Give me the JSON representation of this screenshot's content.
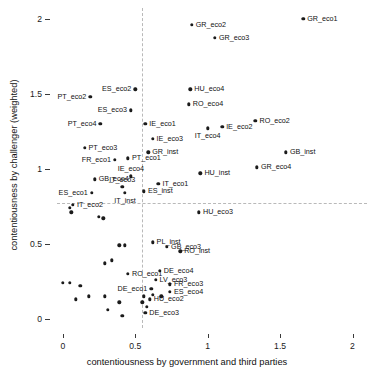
{
  "chart_data": {
    "type": "scatter",
    "title": "",
    "xlabel": "contentiousness by government and third parties",
    "ylabel": "contentiousness by challenger (weighted)",
    "xlim": [
      -0.04,
      2.1
    ],
    "ylim": [
      -0.06,
      2.07
    ],
    "xticks": [
      0,
      0.5,
      1,
      1.5,
      2
    ],
    "xticklabels": [
      "0",
      "0.5",
      "1",
      "1.5",
      "2"
    ],
    "yticks": [
      0,
      0.5,
      1,
      1.5,
      2
    ],
    "yticklabels": [
      "0",
      "0.5",
      "1",
      "1.5",
      "2"
    ],
    "grid": false,
    "legend": null,
    "reference_lines": [
      {
        "orientation": "vertical",
        "value": 0.55,
        "style": "dashed",
        "color": "#b9b9b9"
      },
      {
        "orientation": "horizontal",
        "value": 0.77,
        "style": "dashed",
        "color": "#b9b9b9"
      }
    ],
    "marker_color": "#1b1b1b",
    "points": [
      {
        "label": "GR_eco1",
        "x": 1.66,
        "y": 2.0,
        "pos": "right"
      },
      {
        "label": "GR_eco2",
        "x": 0.89,
        "y": 1.96,
        "pos": "right"
      },
      {
        "label": "GR_eco3",
        "x": 1.05,
        "y": 1.87,
        "pos": "right"
      },
      {
        "label": "ES_eco2",
        "x": 0.5,
        "y": 1.53,
        "pos": "left"
      },
      {
        "label": "HU_eco4",
        "x": 0.88,
        "y": 1.53,
        "pos": "right"
      },
      {
        "label": "PT_eco2",
        "x": 0.19,
        "y": 1.48,
        "pos": "left"
      },
      {
        "label": "RO_eco4",
        "x": 0.87,
        "y": 1.43,
        "pos": "right"
      },
      {
        "label": "ES_eco3",
        "x": 0.47,
        "y": 1.39,
        "pos": "left"
      },
      {
        "label": "RO_eco2",
        "x": 1.33,
        "y": 1.32,
        "pos": "right"
      },
      {
        "label": "IE_eco1",
        "x": 0.57,
        "y": 1.3,
        "pos": "right"
      },
      {
        "label": "PT_eco4",
        "x": 0.26,
        "y": 1.3,
        "pos": "left"
      },
      {
        "label": "IE_eco2",
        "x": 1.1,
        "y": 1.28,
        "pos": "right"
      },
      {
        "label": "IT_eco4",
        "x": 1.0,
        "y": 1.27,
        "pos": "below"
      },
      {
        "label": "IE_eco3",
        "x": 0.62,
        "y": 1.2,
        "pos": "right"
      },
      {
        "label": "PT_eco3",
        "x": 0.15,
        "y": 1.14,
        "pos": "right"
      },
      {
        "label": "GB_inst",
        "x": 1.54,
        "y": 1.11,
        "pos": "right"
      },
      {
        "label": "GR_inst",
        "x": 0.59,
        "y": 1.11,
        "pos": "right"
      },
      {
        "label": "PT_eco1",
        "x": 0.45,
        "y": 1.07,
        "pos": "right"
      },
      {
        "label": "FR_eco1",
        "x": 0.36,
        "y": 1.06,
        "pos": "left"
      },
      {
        "label": "GR_eco4",
        "x": 1.34,
        "y": 1.01,
        "pos": "right"
      },
      {
        "label": "HU_inst",
        "x": 0.95,
        "y": 0.97,
        "pos": "right"
      },
      {
        "label": "IE_eco4",
        "x": 0.47,
        "y": 0.95,
        "pos": "above"
      },
      {
        "label": "GB_eco4",
        "x": 0.22,
        "y": 0.93,
        "pos": "right"
      },
      {
        "label": "IT_eco1",
        "x": 0.66,
        "y": 0.9,
        "pos": "right"
      },
      {
        "label": "IT_eco3",
        "x": 0.41,
        "y": 0.88,
        "pos": "above"
      },
      {
        "label": "ES_eco1",
        "x": 0.2,
        "y": 0.84,
        "pos": "left"
      },
      {
        "label": "ES_inst",
        "x": 0.56,
        "y": 0.85,
        "pos": "right"
      },
      {
        "label": "IT_inst",
        "x": 0.43,
        "y": 0.84,
        "pos": "below"
      },
      {
        "label": "IT_eco2",
        "x": 0.07,
        "y": 0.76,
        "pos": "right"
      },
      {
        "label": "HU_eco3",
        "x": 0.94,
        "y": 0.71,
        "pos": "right"
      },
      {
        "label": "PL_inst",
        "x": 0.62,
        "y": 0.51,
        "pos": "right"
      },
      {
        "label": "GB_eco3",
        "x": 0.72,
        "y": 0.48,
        "pos": "right"
      },
      {
        "label": "RO_inst",
        "x": 0.81,
        "y": 0.45,
        "pos": "right"
      },
      {
        "label": "DE_eco4",
        "x": 0.67,
        "y": 0.32,
        "pos": "right"
      },
      {
        "label": "RO_eco1",
        "x": 0.45,
        "y": 0.3,
        "pos": "right"
      },
      {
        "label": "LV_eco3",
        "x": 0.64,
        "y": 0.26,
        "pos": "right"
      },
      {
        "label": "FR_eco3",
        "x": 0.74,
        "y": 0.23,
        "pos": "right"
      },
      {
        "label": "DE_eco1",
        "x": 0.61,
        "y": 0.2,
        "pos": "left"
      },
      {
        "label": "ES_eco4",
        "x": 0.74,
        "y": 0.18,
        "pos": "right"
      },
      {
        "label": "HU_eco2",
        "x": 0.6,
        "y": 0.13,
        "pos": "right"
      },
      {
        "label": "DE_eco3",
        "x": 0.57,
        "y": 0.04,
        "pos": "right"
      }
    ],
    "unlabeled_points": [
      {
        "x": 0.05,
        "y": 0.74
      },
      {
        "x": 0.06,
        "y": 0.71
      },
      {
        "x": 0.25,
        "y": 0.68
      },
      {
        "x": 0.28,
        "y": 0.67
      },
      {
        "x": 0.39,
        "y": 0.49
      },
      {
        "x": 0.43,
        "y": 0.49
      },
      {
        "x": 0.29,
        "y": 0.37
      },
      {
        "x": 0.34,
        "y": 0.39
      },
      {
        "x": 0.0,
        "y": 0.24
      },
      {
        "x": 0.05,
        "y": 0.24
      },
      {
        "x": 0.12,
        "y": 0.22
      },
      {
        "x": 0.09,
        "y": 0.13
      },
      {
        "x": 0.18,
        "y": 0.15
      },
      {
        "x": 0.29,
        "y": 0.15
      },
      {
        "x": 0.31,
        "y": 0.06
      },
      {
        "x": 0.39,
        "y": 0.11
      },
      {
        "x": 0.41,
        "y": 0.02
      },
      {
        "x": 0.56,
        "y": 0.15
      },
      {
        "x": 0.55,
        "y": 0.11
      },
      {
        "x": 0.58,
        "y": 0.08
      },
      {
        "x": 0.62,
        "y": 0.16
      },
      {
        "x": 0.68,
        "y": 0.15
      }
    ]
  }
}
